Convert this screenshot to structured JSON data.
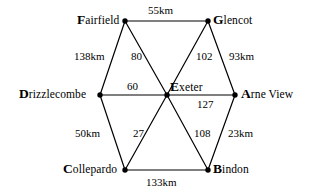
{
  "diagram": {
    "type": "weighted-graph",
    "title": "",
    "background_color": "#ffffff",
    "line_color": "#000000",
    "text_color": "#000000",
    "nodes": [
      {
        "id": "fairfield",
        "label": "Fairfield",
        "cap": "F",
        "rest": "airfield",
        "x": 125,
        "y": 21
      },
      {
        "id": "glencot",
        "label": "Glencot",
        "cap": "G",
        "rest": "lencot",
        "x": 208,
        "y": 21
      },
      {
        "id": "drizzlecombe",
        "label": "Drizzlecombe",
        "cap": "D",
        "rest": "rizzlecombe",
        "x": 100,
        "y": 95
      },
      {
        "id": "exeter",
        "label": "Exeter",
        "cap": "E",
        "rest": "xeter",
        "x": 167,
        "y": 95
      },
      {
        "id": "arneview",
        "label": "Arne View",
        "cap": "A",
        "rest": "rne View",
        "x": 235,
        "y": 95
      },
      {
        "id": "collepardo",
        "label": "Collepardo",
        "cap": "C",
        "rest": "ollepardo",
        "x": 125,
        "y": 170
      },
      {
        "id": "bindon",
        "label": "Bindon",
        "cap": "B",
        "rest": "indon",
        "x": 208,
        "y": 170
      }
    ],
    "edges": [
      {
        "id": "fairfield-glencot",
        "from": "fairfield",
        "to": "glencot",
        "weight": "55km"
      },
      {
        "id": "fairfield-drizzlecombe",
        "from": "fairfield",
        "to": "drizzlecombe",
        "weight": "138km"
      },
      {
        "id": "fairfield-exeter",
        "from": "fairfield",
        "to": "exeter",
        "weight": "80"
      },
      {
        "id": "glencot-exeter",
        "from": "glencot",
        "to": "exeter",
        "weight": "102"
      },
      {
        "id": "glencot-arneview",
        "from": "glencot",
        "to": "arneview",
        "weight": "93km"
      },
      {
        "id": "drizzlecombe-exeter",
        "from": "drizzlecombe",
        "to": "exeter",
        "weight": "60"
      },
      {
        "id": "exeter-arneview",
        "from": "exeter",
        "to": "arneview",
        "weight": "127"
      },
      {
        "id": "drizzlecombe-collepardo",
        "from": "drizzlecombe",
        "to": "collepardo",
        "weight": "50km"
      },
      {
        "id": "collepardo-exeter",
        "from": "collepardo",
        "to": "exeter",
        "weight": "27"
      },
      {
        "id": "exeter-bindon",
        "from": "exeter",
        "to": "bindon",
        "weight": "108"
      },
      {
        "id": "bindon-arneview",
        "from": "bindon",
        "to": "arneview",
        "weight": "23km"
      },
      {
        "id": "collepardo-bindon",
        "from": "collepardo",
        "to": "bindon",
        "weight": "133km"
      }
    ],
    "labels": {
      "fairfield_glencot_weight": "55km",
      "fairfield_drizzlecombe_weight": "138km",
      "fairfield_exeter_weight": "80",
      "glencot_exeter_weight": "102",
      "glencot_arneview_weight": "93km",
      "drizzlecombe_exeter_weight": "60",
      "exeter_arneview_weight": "127",
      "drizzlecombe_collepardo_weight": "50km",
      "collepardo_exeter_weight": "27",
      "exeter_bindon_weight": "108",
      "bindon_arneview_weight": "23km",
      "collepardo_bindon_weight": "133km"
    }
  }
}
